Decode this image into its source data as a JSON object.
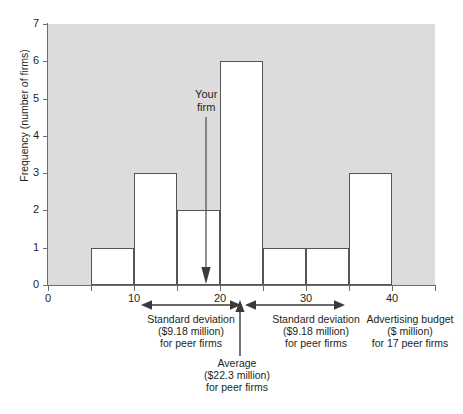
{
  "chart_data": {
    "type": "bar",
    "title": "",
    "subtitle": "",
    "xlabel": "Advertising budget ($ million) for 17 peer firms",
    "ylabel": "Frequency (number of firms)",
    "xlim": [
      0,
      45
    ],
    "ylim": [
      0,
      7
    ],
    "grid": false,
    "legend": "none",
    "bin_width": 5,
    "categories": [
      "0-5",
      "5-10",
      "10-15",
      "15-20",
      "20-25",
      "25-30",
      "30-35",
      "35-40",
      "40-45"
    ],
    "bin_edges": [
      0,
      5,
      10,
      15,
      20,
      25,
      30,
      35,
      40,
      45
    ],
    "values": [
      0,
      1,
      3,
      2,
      6,
      1,
      1,
      3,
      0
    ],
    "x_ticks": [
      0,
      10,
      20,
      30,
      40
    ],
    "x_tick_labels": [
      "0",
      "10",
      "20",
      "30",
      "40"
    ],
    "x_minor_ticks": [
      5,
      15,
      25,
      35,
      45
    ],
    "y_ticks": [
      0,
      1,
      2,
      3,
      4,
      5,
      6,
      7
    ],
    "y_tick_labels": [
      "0",
      "1",
      "2",
      "3",
      "4",
      "5",
      "6",
      "7"
    ],
    "annotations": [
      {
        "name": "your-firm",
        "label": "Your\nfirm",
        "x_value": 18.4,
        "points_to_y": 0
      },
      {
        "name": "average",
        "label": "Average\n($22.3 million)\nfor peer firms",
        "x_value": 22.3
      },
      {
        "name": "standard-deviation-left",
        "label": "Standard deviation\n($9.18 million)\nfor peer firms",
        "span": [
          13.1,
          22.3
        ]
      },
      {
        "name": "standard-deviation-right",
        "label": "Standard deviation\n($9.18 million)\nfor peer firms",
        "span": [
          22.3,
          31.5
        ]
      },
      {
        "name": "axis-caption",
        "label": "Advertising budget\n($ million)\nfor 17 peer firms"
      }
    ]
  },
  "axes": {
    "y_title": "Frequency (number of firms)",
    "y_tick_labels": [
      "0",
      "1",
      "2",
      "3",
      "4",
      "5",
      "6",
      "7"
    ],
    "x_tick_labels": [
      "0",
      "10",
      "20",
      "30",
      "40"
    ]
  },
  "annotations": {
    "your_firm": "Your\nfirm",
    "average": "Average\n($22.3 million)\nfor peer firms",
    "sd_left": "Standard deviation\n($9.18 million)\nfor peer firms",
    "sd_right": "Standard deviation\n($9.18 million)\nfor peer firms",
    "x_caption": "Advertising budget\n($ million)\nfor 17 peer firms"
  },
  "colors": {
    "plot_background": "#dcdcdc",
    "bar_fill": "#ffffff",
    "bar_stroke": "#555555",
    "axis": "#6d6d6d",
    "text": "#231f20",
    "page_background": "#ffffff"
  }
}
